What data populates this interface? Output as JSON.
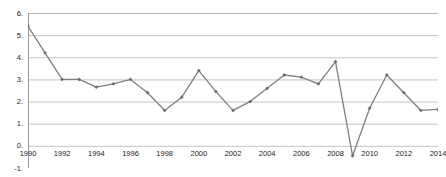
{
  "chart_data": {
    "type": "line",
    "title": "",
    "subtitle": "",
    "xlabel": "",
    "ylabel": "",
    "grid": "horizontal",
    "legend": "none",
    "xlim": [
      1990,
      2014
    ],
    "ylim": [
      -1,
      6
    ],
    "y_tick_labels": [
      "6.",
      "5.",
      "4.",
      "3.",
      "2.",
      "1.",
      "0.",
      "-1."
    ],
    "y_ticks": [
      6,
      5,
      4,
      3,
      2,
      1,
      0,
      -1
    ],
    "x_tick_labels": [
      "1990",
      "1992",
      "1994",
      "1996",
      "1998",
      "2000",
      "2002",
      "2004",
      "2006",
      "2008",
      "2010",
      "2012",
      "2014"
    ],
    "x_ticks": [
      1990,
      1992,
      1994,
      1996,
      1998,
      2000,
      2002,
      2004,
      2006,
      2008,
      2010,
      2012,
      2014
    ],
    "x": [
      1990,
      1991,
      1992,
      1993,
      1994,
      1995,
      1996,
      1997,
      1998,
      1999,
      2000,
      2001,
      2002,
      2003,
      2004,
      2005,
      2006,
      2007,
      2008,
      2009,
      2010,
      2011,
      2012,
      2013,
      2014
    ],
    "values": [
      5.4,
      4.2,
      3.0,
      3.0,
      2.65,
      2.8,
      3.0,
      2.4,
      1.6,
      2.2,
      3.4,
      2.45,
      1.6,
      2.0,
      2.6,
      3.2,
      3.1,
      2.8,
      3.8,
      -0.45,
      1.7,
      3.2,
      2.4,
      1.6,
      1.65
    ],
    "series": [
      {
        "name": "series-1",
        "color": "#808080",
        "marker": "diamond",
        "values": [
          5.4,
          4.2,
          3.0,
          3.0,
          2.65,
          2.8,
          3.0,
          2.4,
          1.6,
          2.2,
          3.4,
          2.45,
          1.6,
          2.0,
          2.6,
          3.2,
          3.1,
          2.8,
          3.8,
          -0.45,
          1.7,
          3.2,
          2.4,
          1.6,
          1.65
        ]
      }
    ]
  },
  "style": {
    "line_color": "#7f7f7f",
    "marker_color": "#6e6e6e",
    "grid_color": "#b6b6b6",
    "axis_color": "#9a9a9a",
    "background": "#ffffff",
    "text_color": "#1a1a1a"
  }
}
